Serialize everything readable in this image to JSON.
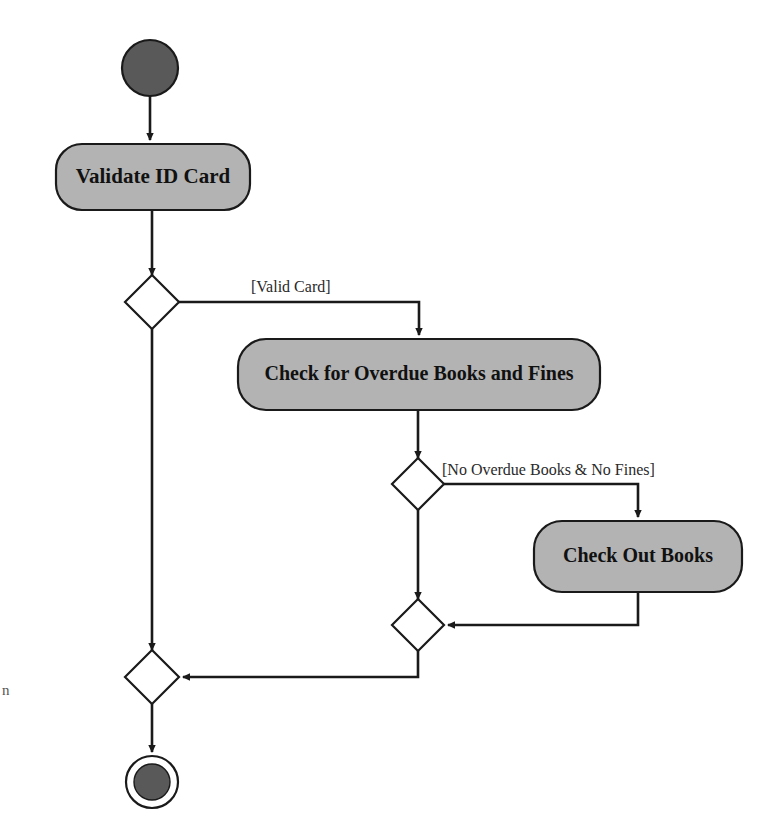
{
  "diagram": {
    "type": "uml-activity-diagram",
    "background_color": "#ffffff",
    "node_fill_color": "#b3b3b3",
    "node_stroke_color": "#1a1a1a",
    "terminal_fill_color": "#595959",
    "edge_color": "#1a1a1a",
    "nodes": [
      {
        "id": "start",
        "kind": "initial-node",
        "label": "",
        "cx": 150,
        "cy": 68,
        "r": 28
      },
      {
        "id": "activity-validate-id-card",
        "kind": "activity",
        "label": "Validate ID Card",
        "x": 56,
        "y": 144,
        "width": 194,
        "height": 66,
        "rx": 26,
        "font_size": 21
      },
      {
        "id": "decision-valid-card",
        "kind": "decision",
        "label": "",
        "cx": 152,
        "cy": 302,
        "half_width": 27,
        "half_height": 27
      },
      {
        "id": "activity-check-overdue",
        "kind": "activity",
        "label": "Check for Overdue Books and Fines",
        "x": 238,
        "y": 339,
        "width": 362,
        "height": 71,
        "rx": 28,
        "font_size": 20
      },
      {
        "id": "decision-no-overdue",
        "kind": "decision",
        "label": "",
        "cx": 418,
        "cy": 484,
        "half_width": 26,
        "half_height": 26
      },
      {
        "id": "activity-check-out-books",
        "kind": "activity",
        "label": "Check Out Books",
        "x": 534,
        "y": 521,
        "width": 208,
        "height": 71,
        "rx": 28,
        "font_size": 20
      },
      {
        "id": "merge-inner",
        "kind": "merge",
        "label": "",
        "cx": 418,
        "cy": 625,
        "half_width": 26,
        "half_height": 26
      },
      {
        "id": "merge-outer",
        "kind": "merge",
        "label": "",
        "cx": 152,
        "cy": 677,
        "half_width": 27,
        "half_height": 27
      },
      {
        "id": "final",
        "kind": "final-node",
        "label": "",
        "cx": 152,
        "cy": 782,
        "outer_r": 26,
        "inner_r": 18
      }
    ],
    "edges": [
      {
        "id": "edge-start-to-validate",
        "from": "start",
        "to": "activity-validate-id-card",
        "guard": "",
        "path": "M150,96 L150,140",
        "arrow": true
      },
      {
        "id": "edge-validate-to-decision",
        "from": "activity-validate-id-card",
        "to": "decision-valid-card",
        "guard": "",
        "path": "M152,210 L152,275",
        "arrow": true
      },
      {
        "id": "edge-valid-card-branch",
        "from": "decision-valid-card",
        "to": "activity-check-overdue",
        "guard": "[Valid Card]",
        "path": "M179,302 L419,302 L419,335",
        "arrow": true
      },
      {
        "id": "edge-decision-to-merge-outer",
        "from": "decision-valid-card",
        "to": "merge-outer",
        "guard": "",
        "path": "M152,329 L152,650",
        "arrow": true
      },
      {
        "id": "edge-overdue-to-decision",
        "from": "activity-check-overdue",
        "to": "decision-no-overdue",
        "guard": "",
        "path": "M418,410 L418,458",
        "arrow": true
      },
      {
        "id": "edge-no-overdue-branch",
        "from": "decision-no-overdue",
        "to": "activity-check-out-books",
        "guard": "[No Overdue Books & No Fines]",
        "path": "M444,484 L638,484 L638,517",
        "arrow": true
      },
      {
        "id": "edge-decision-to-merge-inner",
        "from": "decision-no-overdue",
        "to": "merge-inner",
        "guard": "",
        "path": "M418,510 L418,599",
        "arrow": true
      },
      {
        "id": "edge-checkout-to-merge-inner",
        "from": "activity-check-out-books",
        "to": "merge-inner",
        "guard": "",
        "path": "M638,592 L638,625 L448,625",
        "arrow": true
      },
      {
        "id": "edge-merge-inner-to-merge-outer",
        "from": "merge-inner",
        "to": "merge-outer",
        "guard": "",
        "path": "M418,651 L418,677 L183,677",
        "arrow": true
      },
      {
        "id": "edge-merge-outer-to-final",
        "from": "merge-outer",
        "to": "final",
        "guard": "",
        "path": "M152,704 L152,752",
        "arrow": true
      }
    ],
    "guards": [
      {
        "id": "guard-valid-card",
        "text": "[Valid Card]",
        "x": 251,
        "y": 288,
        "font_size": 16
      },
      {
        "id": "guard-no-overdue",
        "text": "[No Overdue Books & No Fines]",
        "x": 442,
        "y": 471,
        "font_size": 16
      }
    ],
    "artifact": {
      "text": "n",
      "x": 2,
      "y": 682
    }
  }
}
